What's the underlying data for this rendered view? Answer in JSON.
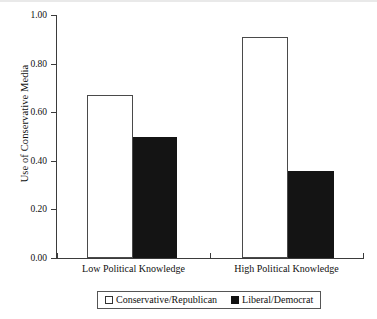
{
  "chart_data": {
    "type": "bar",
    "title": "",
    "subtitle": "",
    "xlabel": "",
    "ylabel": "Use of Conservative Media",
    "categories": [
      "Low Political Knowledge",
      "High Political Knowledge"
    ],
    "series": [
      {
        "name": "Conservative/Republican",
        "style": "open",
        "color": "#ffffff",
        "edge_color": "#4a4a4a",
        "values": [
          0.67,
          0.91
        ]
      },
      {
        "name": "Liberal/Democrat",
        "style": "filled",
        "color": "#141414",
        "edge_color": "#141414",
        "values": [
          0.5,
          0.36
        ]
      }
    ],
    "ylim": [
      0.0,
      1.0
    ],
    "ytick_labels": [
      "0.00",
      "0.20",
      "0.40",
      "0.60",
      "0.80",
      "1.00"
    ],
    "ytick_values": [
      0.0,
      0.2,
      0.4,
      0.6,
      0.8,
      1.0
    ],
    "grid": false,
    "legend_position": "bottom",
    "legend_entries": [
      "Conservative/Republican",
      "Liberal/Democrat"
    ]
  },
  "axes": {
    "y_title": "Use of Conservative Media",
    "y_labels": {
      "t0": "0.00",
      "t1": "0.20",
      "t2": "0.40",
      "t3": "0.60",
      "t4": "0.80",
      "t5": "1.00"
    },
    "x_labels": {
      "group1": "Low Political Knowledge",
      "group2": "High Political Knowledge"
    }
  },
  "legend": {
    "entry1": "Conservative/Republican",
    "entry2": "Liberal/Democrat"
  }
}
